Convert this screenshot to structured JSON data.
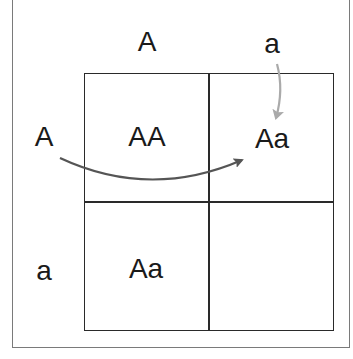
{
  "diagram": {
    "column_headers": [
      "A",
      "a"
    ],
    "row_headers": [
      "A",
      "a"
    ],
    "cells": [
      [
        "AA",
        "Aa"
      ],
      [
        "Aa",
        ""
      ]
    ],
    "arrows": [
      {
        "from": "row-header-A",
        "to": "cell-0-1",
        "color": "#555555"
      },
      {
        "from": "column-header-a",
        "to": "cell-0-1",
        "color": "#aaaaaa"
      }
    ]
  }
}
